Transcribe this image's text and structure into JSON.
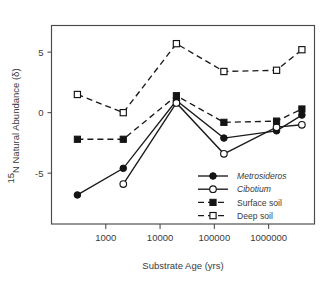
{
  "chart_data": {
    "type": "line",
    "title": "",
    "xlabel": "Substrate Age (yrs)",
    "ylabel": "15N Natural Abundance (δ)",
    "ylabel_superscript": "15",
    "ylabel_rest": "N Natural Abundance (δ)",
    "xscale": "log",
    "xlim": [
      100,
      7000000
    ],
    "ylim": [
      -9.2,
      7.2
    ],
    "yticks": [
      5,
      0,
      -5
    ],
    "ytick_labels": [
      "5",
      "0",
      "-5"
    ],
    "xticks": [
      1000,
      10000,
      100000,
      1000000
    ],
    "xtick_labels": [
      "1000",
      "10000",
      "100000",
      "1000000"
    ],
    "grid": false,
    "legend_position": "lower-right-inside",
    "x": [
      300,
      2100,
      20000,
      150000,
      1400000,
      4100000
    ],
    "series": [
      {
        "name": "Metrosideros",
        "italic": true,
        "marker": "filled-circle",
        "line": "solid",
        "color": "#141414",
        "values": [
          -6.8,
          -4.6,
          1.0,
          -2.1,
          -1.5,
          -0.2
        ]
      },
      {
        "name": "Cibotium",
        "italic": true,
        "marker": "open-circle",
        "line": "solid",
        "color": "#141414",
        "values": [
          null,
          -5.9,
          0.8,
          -3.4,
          -1.2,
          -1.0
        ]
      },
      {
        "name": "Surface soil",
        "italic": false,
        "marker": "filled-square",
        "line": "dashed",
        "color": "#141414",
        "values": [
          -2.2,
          -2.2,
          1.4,
          -0.8,
          -0.7,
          0.3
        ]
      },
      {
        "name": "Deep soil",
        "italic": false,
        "marker": "open-square",
        "line": "dashed",
        "color": "#141414",
        "values": [
          1.5,
          0.0,
          5.7,
          3.4,
          3.5,
          5.2
        ]
      }
    ]
  },
  "legend": {
    "entries": [
      {
        "label": "Metrosideros"
      },
      {
        "label": "Cibotium"
      },
      {
        "label": "Surface soil"
      },
      {
        "label": "Deep soil"
      }
    ]
  }
}
